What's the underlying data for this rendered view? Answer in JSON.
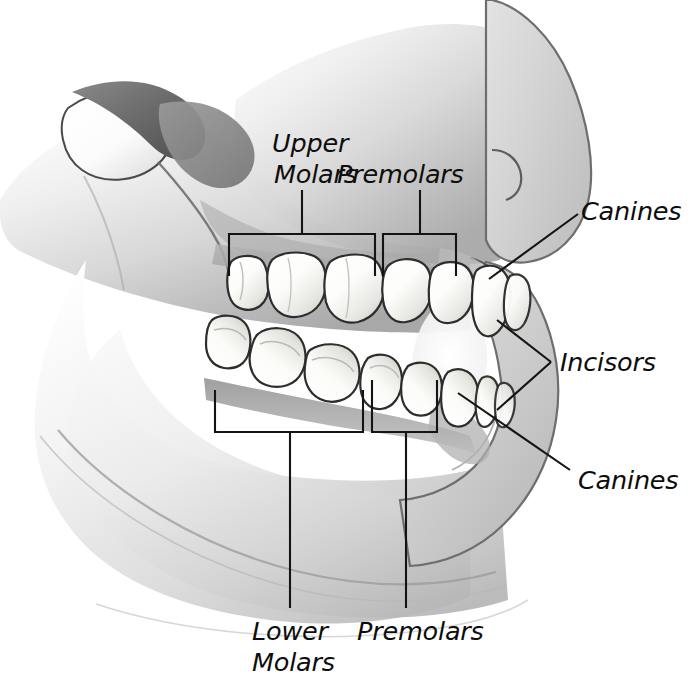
{
  "figure": {
    "background_color": "#ffffff",
    "line_color": "#141414",
    "label_color": "#0d0d0d",
    "tooth_enamel_color": "#fdfdfb",
    "tissue_light": "#e9e9e9",
    "tissue_mid": "#c9c9c9",
    "tissue_dark": "#8f8f8f",
    "tissue_shadow": "#5a5a5a"
  },
  "labels": {
    "upper_molars_line1": "Upper",
    "upper_molars_line2": "Molars",
    "premolars_upper": "Premolars",
    "canines_upper": "Canines",
    "incisors": "Incisors",
    "canines_lower": "Canines",
    "lower_molars_line1": "Lower",
    "lower_molars_line2": "Molars",
    "premolars_lower": "Premolars"
  },
  "annotations": [
    {
      "id": "upper-molars",
      "text": "Upper Molars",
      "type": "bracket",
      "bracket": {
        "x": 229,
        "y": 234,
        "width": 146,
        "height": 42,
        "side": "top"
      },
      "stem": {
        "x": 302,
        "y_from": 190,
        "y_to": 234
      },
      "label_position": {
        "x": 272,
        "y": 152
      }
    },
    {
      "id": "premolars-upper",
      "text": "Premolars",
      "type": "bracket",
      "bracket": {
        "x": 383,
        "y": 234,
        "width": 73,
        "height": 42,
        "side": "top"
      },
      "stem": {
        "x": 420,
        "y_from": 190,
        "y_to": 234
      },
      "label_position": {
        "x": 338,
        "y": 182
      }
    },
    {
      "id": "canines-upper",
      "text": "Canines",
      "type": "leader",
      "leader": {
        "x1": 489,
        "y1": 279,
        "x2": 578,
        "y2": 214
      },
      "label_position": {
        "x": 583,
        "y": 218
      }
    },
    {
      "id": "incisors",
      "text": "Incisors",
      "type": "double-leader",
      "leaders": [
        {
          "x1": 497,
          "y1": 320,
          "x2": 551,
          "y2": 362
        },
        {
          "x1": 497,
          "y1": 410,
          "x2": 551,
          "y2": 362
        }
      ],
      "label_position": {
        "x": 560,
        "y": 370
      }
    },
    {
      "id": "canines-lower",
      "text": "Canines",
      "type": "leader",
      "leader": {
        "x1": 458,
        "y1": 393,
        "x2": 570,
        "y2": 470
      },
      "label_position": {
        "x": 578,
        "y": 487
      }
    },
    {
      "id": "lower-molars",
      "text": "Lower Molars",
      "type": "bracket",
      "bracket": {
        "x": 215,
        "y": 390,
        "width": 148,
        "height": 42,
        "side": "bottom"
      },
      "stem": {
        "x": 290,
        "y_from": 432,
        "y_to": 608
      },
      "label_position": {
        "x": 257,
        "y": 637
      }
    },
    {
      "id": "premolars-lower",
      "text": "Premolars",
      "type": "bracket",
      "bracket": {
        "x": 372,
        "y": 380,
        "width": 65,
        "height": 52,
        "side": "bottom"
      },
      "stem": {
        "x": 406,
        "y_from": 432,
        "y_to": 608
      },
      "label_position": {
        "x": 360,
        "y": 637
      }
    }
  ],
  "teeth": {
    "upper_row_count": 8,
    "lower_row_count": 8,
    "groups": [
      "Molars",
      "Premolars",
      "Canines",
      "Incisors"
    ]
  }
}
